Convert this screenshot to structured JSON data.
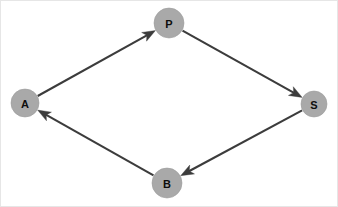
{
  "diagram": {
    "type": "directed-graph",
    "width": 338,
    "height": 207,
    "background_color": "#ffffff",
    "border_color": "#e6e6e6",
    "node_fill_color": "#a9a9a9",
    "node_label_color": "#0d0d0d",
    "edge_color": "#3c3c3c",
    "edge_width": 2.1,
    "nodes": [
      {
        "id": "P",
        "label": "P",
        "cx": 168,
        "cy": 22,
        "r": 15
      },
      {
        "id": "A",
        "label": "A",
        "cx": 24,
        "cy": 102,
        "r": 14
      },
      {
        "id": "S",
        "label": "S",
        "cx": 313,
        "cy": 103,
        "r": 13
      },
      {
        "id": "B",
        "label": "B",
        "cx": 166,
        "cy": 182,
        "r": 15
      }
    ],
    "edges": [
      {
        "id": "a-to-p",
        "from": "A",
        "to": "P",
        "directed": true,
        "label": ""
      },
      {
        "id": "p-to-s",
        "from": "P",
        "to": "S",
        "directed": true,
        "label": ""
      },
      {
        "id": "s-to-b",
        "from": "S",
        "to": "B",
        "directed": true,
        "label": ""
      },
      {
        "id": "b-to-a",
        "from": "B",
        "to": "A",
        "directed": true,
        "label": ""
      }
    ]
  }
}
